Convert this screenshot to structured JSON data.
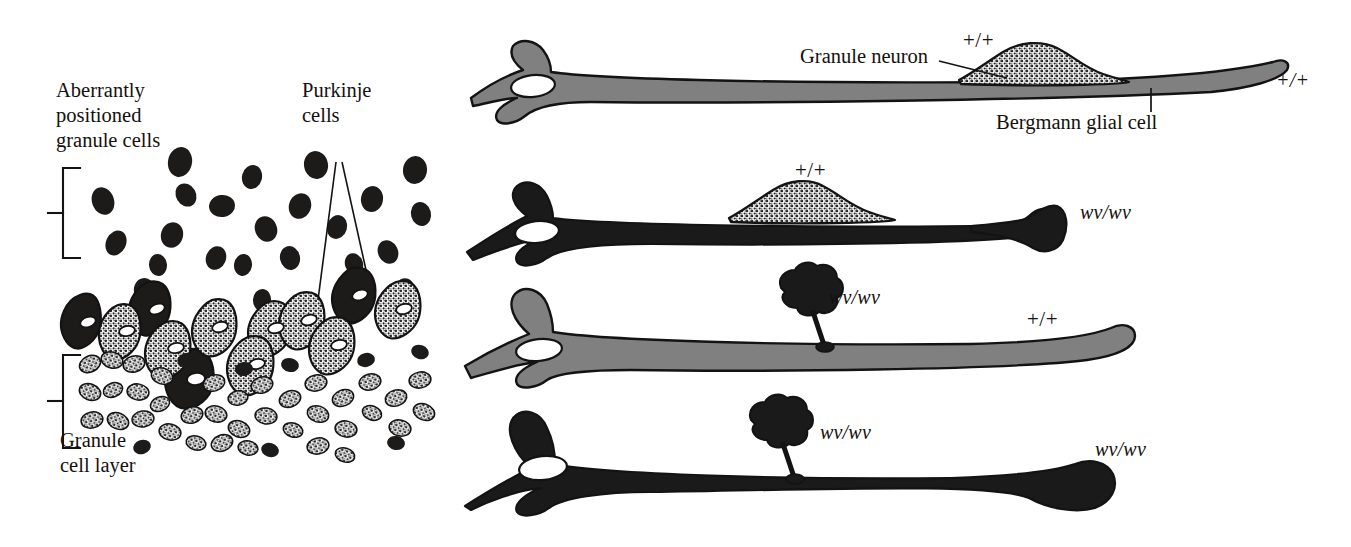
{
  "figure": {
    "title_visible": false,
    "background": "#ffffff",
    "ink": "#14110f",
    "gray_fill": "#7d7d7d",
    "dark_fill": "#1a1a1a"
  },
  "left_panel": {
    "name": "cerebellar-cortex-histology",
    "labels": {
      "aberrant": "Aberrantly\npositioned\ngranule cells",
      "purkinje": "Purkinje\ncells",
      "granule_layer": "Granule\ncell layer"
    },
    "brackets": [
      {
        "name": "aberrant-bracket",
        "x": 62,
        "y_top": 168,
        "y_bottom": 258
      },
      {
        "name": "granule-layer-bracket",
        "x": 62,
        "y_top": 355,
        "y_bottom": 448
      }
    ],
    "leader_lines": [
      {
        "from": "purkinje-cells",
        "to": "purkinje-cell-1"
      },
      {
        "from": "purkinje-cells",
        "to": "purkinje-cell-2"
      }
    ],
    "cell_counts": {
      "aberrant_granule_cells": 22,
      "purkinje_cells": 13,
      "granule_layer_cells": 46
    }
  },
  "right_panel": {
    "name": "bergmann-glia-chimera-rows",
    "labels": {
      "granule_neuron": "Granule neuron",
      "bergmann_glial_cell": "Bergmann glial cell"
    },
    "rows": [
      {
        "id": "row-1",
        "glia_genotype": "+/+",
        "glia_fill": "gray",
        "neuron_genotype": "+/+",
        "neuron_fill": "stippled",
        "neuron_label_top": "+/+",
        "glia_label_right": "+/+",
        "neuron_attached": true,
        "neuron_shape": "spread-migrating"
      },
      {
        "id": "row-2",
        "glia_genotype": "wv/wv",
        "glia_fill": "black",
        "neuron_genotype": "+/+",
        "neuron_fill": "stippled",
        "neuron_label_top": "+/+",
        "glia_label_right": "wv/wv",
        "neuron_attached": true,
        "neuron_shape": "spread-migrating"
      },
      {
        "id": "row-3",
        "glia_genotype": "+/+",
        "glia_fill": "gray",
        "neuron_genotype": "wv/wv",
        "neuron_fill": "black",
        "neuron_label_side": "wv/wv",
        "glia_label_right": "+/+",
        "neuron_attached": false,
        "neuron_shape": "rounded-stalled"
      },
      {
        "id": "row-4",
        "glia_genotype": "wv/wv",
        "glia_fill": "black",
        "neuron_genotype": "wv/wv",
        "neuron_fill": "black",
        "neuron_label_side": "wv/wv",
        "glia_label_right": "wv/wv",
        "neuron_attached": false,
        "neuron_shape": "rounded-stalled"
      }
    ]
  }
}
